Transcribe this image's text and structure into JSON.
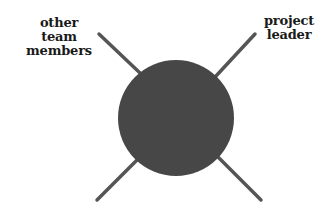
{
  "diagram": {
    "labels": {
      "top_left": [
        "other team",
        "members"
      ],
      "top_right": [
        "project",
        "leader"
      ]
    },
    "colors": {
      "circle": "#474747",
      "lines": "#555555",
      "text": "#1a1a1a",
      "background": "#ffffff"
    },
    "circle": {
      "cx": 176,
      "cy": 118,
      "r": 58
    },
    "lines": [
      {
        "name": "top-left",
        "x1": 99,
        "y1": 34,
        "x2": 140,
        "y2": 73
      },
      {
        "name": "top-right",
        "x1": 255,
        "y1": 34,
        "x2": 216,
        "y2": 76
      },
      {
        "name": "bottom-left",
        "x1": 97,
        "y1": 200,
        "x2": 138,
        "y2": 159
      },
      {
        "name": "bottom-right",
        "x1": 261,
        "y1": 200,
        "x2": 216,
        "y2": 155
      }
    ]
  }
}
